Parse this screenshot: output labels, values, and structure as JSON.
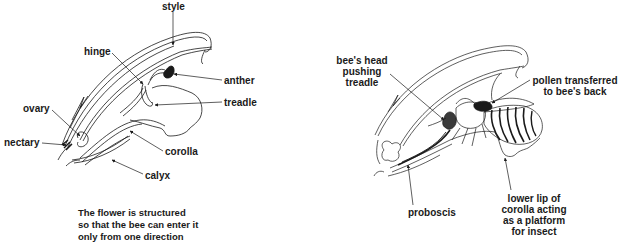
{
  "left_diagram": {
    "labels": {
      "style": "style",
      "hinge": "hinge",
      "anther": "anther",
      "treadle": "treadle",
      "ovary": "ovary",
      "nectary": "nectary",
      "corolla": "corolla",
      "calyx": "calyx"
    },
    "caption": [
      "The flower is structured",
      "so that the bee can enter it",
      "only from one direction"
    ]
  },
  "right_diagram": {
    "labels": {
      "bees_head": [
        "bee's head",
        "pushing",
        "treadle"
      ],
      "pollen": [
        "pollen transferred",
        "to bee's back"
      ],
      "proboscis": "proboscis",
      "lower_lip": [
        "lower lip of",
        "corolla acting",
        "as a platform",
        "for insect"
      ]
    }
  },
  "colors": {
    "ink": "#1a1a1a",
    "background": "#ffffff"
  }
}
